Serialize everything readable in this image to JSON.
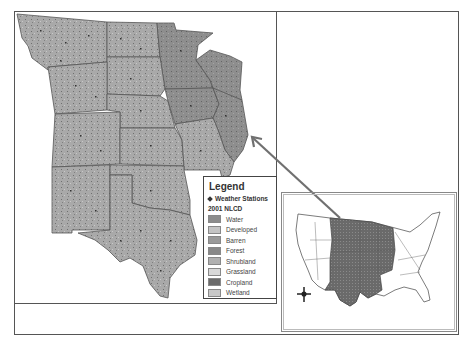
{
  "map": {
    "title": "Central US study region with 2001 NLCD land cover and weather stations",
    "main_region_fill": "#a8a8a8",
    "inset_highlight_fill": "#6e6e6e",
    "arrow_color": "#707070"
  },
  "legend": {
    "title": "Legend",
    "stations_label": "Weather Stations",
    "nlcd_title": "2001 NLCD",
    "items": [
      {
        "label": "Water",
        "color": "#8c8c8c"
      },
      {
        "label": "Developed",
        "color": "#c4c4c4"
      },
      {
        "label": "Barren",
        "color": "#9a9a9a"
      },
      {
        "label": "Forest",
        "color": "#888888"
      },
      {
        "label": "Shrubland",
        "color": "#b0b0b0"
      },
      {
        "label": "Grassland",
        "color": "#d8d8d8"
      },
      {
        "label": "Cropland",
        "color": "#6a6a6a"
      },
      {
        "label": "Wetland",
        "color": "#c8c8c8"
      }
    ]
  },
  "inset": {
    "north_arrow_icon": "compass-cross"
  }
}
